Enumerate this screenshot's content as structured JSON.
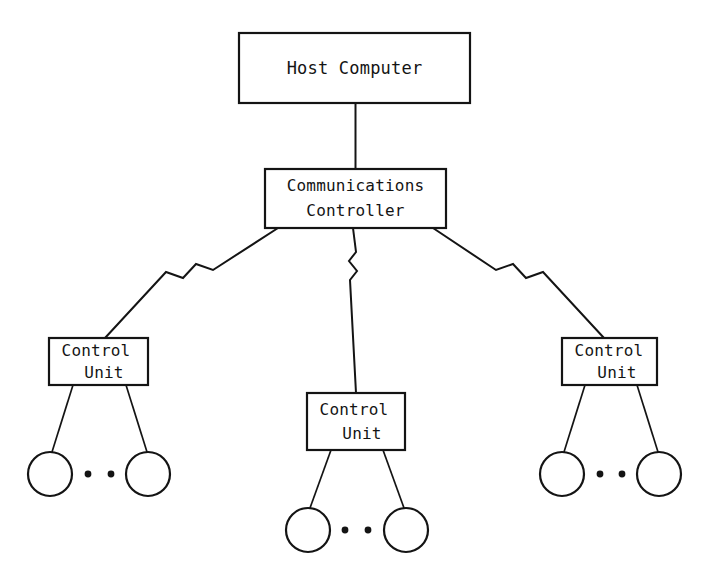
{
  "diagram": {
    "type": "hierarchical-tree",
    "background_color": "#ffffff",
    "line_color": "#141414",
    "nodes": {
      "host": {
        "label": "Host Computer",
        "shape": "rectangle",
        "x": 239,
        "y": 33,
        "width": 231,
        "height": 70
      },
      "comm_controller": {
        "label_line1": "Communications",
        "label_line2": "Controller",
        "shape": "rectangle",
        "x": 265,
        "y": 169,
        "width": 181,
        "height": 59
      },
      "control_unit_left": {
        "label_line1": "Control",
        "label_line2": "Unit",
        "shape": "rectangle",
        "x": 49,
        "y": 338,
        "width": 99,
        "height": 47
      },
      "control_unit_center": {
        "label_line1": "Control",
        "label_line2": "Unit",
        "shape": "rectangle",
        "x": 307,
        "y": 393,
        "width": 98,
        "height": 57
      },
      "control_unit_right": {
        "label_line1": "Control",
        "label_line2": "Unit",
        "shape": "rectangle",
        "x": 562,
        "y": 338,
        "width": 95,
        "height": 47
      }
    },
    "terminal_groups": [
      {
        "group": "left",
        "parent": "control_unit_left",
        "circles": [
          {
            "cx": 50,
            "cy": 474,
            "r": 22
          },
          {
            "cx": 148,
            "cy": 474,
            "r": 22
          }
        ],
        "ellipsis_dots": [
          {
            "cx": 88,
            "cy": 474,
            "r": 3.4
          },
          {
            "cx": 111,
            "cy": 474,
            "r": 3.4
          }
        ]
      },
      {
        "group": "center",
        "parent": "control_unit_center",
        "circles": [
          {
            "cx": 308,
            "cy": 530,
            "r": 22
          },
          {
            "cx": 406,
            "cy": 530,
            "r": 22
          }
        ],
        "ellipsis_dots": [
          {
            "cx": 345,
            "cy": 530,
            "r": 3.4
          },
          {
            "cx": 368,
            "cy": 530,
            "r": 3.4
          }
        ]
      },
      {
        "group": "right",
        "parent": "control_unit_right",
        "circles": [
          {
            "cx": 562,
            "cy": 474,
            "r": 22
          },
          {
            "cx": 659,
            "cy": 474,
            "r": 22
          }
        ],
        "ellipsis_dots": [
          {
            "cx": 600,
            "cy": 474,
            "r": 3.4
          },
          {
            "cx": 622,
            "cy": 474,
            "r": 3.4
          }
        ]
      }
    ],
    "links": [
      {
        "name": "host-to-communications-controller",
        "from": "host",
        "to": "comm_controller",
        "style": "straight-vertical",
        "break_symbol": "none"
      },
      {
        "name": "controller-to-left-control-unit",
        "from": "comm_controller",
        "to": "control_unit_left",
        "style": "diagonal",
        "break_symbol": "zigzag"
      },
      {
        "name": "controller-to-center-control-unit",
        "from": "comm_controller",
        "to": "control_unit_center",
        "style": "vertical",
        "break_symbol": "zigzag"
      },
      {
        "name": "controller-to-right-control-unit",
        "from": "comm_controller",
        "to": "control_unit_right",
        "style": "diagonal",
        "break_symbol": "zigzag"
      }
    ]
  }
}
